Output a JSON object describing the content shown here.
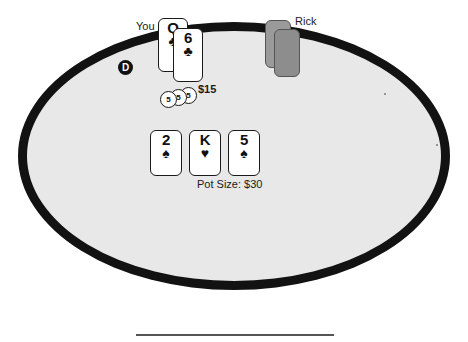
{
  "table": {
    "felt_color": "#e8e8e8",
    "border_color": "#121212"
  },
  "dealer": {
    "button_label": "D",
    "name": "dealer-button"
  },
  "players": [
    {
      "label": "You",
      "is_hero": true,
      "bet_amount": "$15",
      "chips": [
        {
          "value": "5"
        },
        {
          "value": "5"
        },
        {
          "value": "5"
        }
      ],
      "hole_cards": [
        {
          "rank": "Q",
          "suit": "♣",
          "suit_name": "clubs",
          "color": "black"
        },
        {
          "rank": "6",
          "suit": "♣",
          "suit_name": "clubs",
          "color": "black"
        }
      ]
    },
    {
      "label": "Rick",
      "is_hero": false,
      "hole_cards": [
        {
          "face_down": true
        },
        {
          "face_down": true
        }
      ]
    }
  ],
  "board": {
    "cards": [
      {
        "rank": "2",
        "suit": "♠",
        "suit_name": "spades",
        "color": "black"
      },
      {
        "rank": "K",
        "suit": "♥",
        "suit_name": "hearts",
        "color": "black"
      },
      {
        "rank": "5",
        "suit": "♠",
        "suit_name": "spades",
        "color": "black"
      }
    ]
  },
  "pot": {
    "text": "Pot Size: $30"
  }
}
